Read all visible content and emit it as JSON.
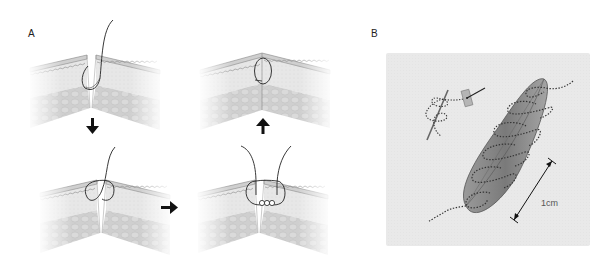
{
  "figure": {
    "panels": [
      {
        "id": "A",
        "label": "A",
        "description": "Four-step interrupted suture sequence through layered skin tissue",
        "steps": [
          {
            "step": 1,
            "state": "needle-through-wound-edges"
          },
          {
            "step": 2,
            "state": "loop-formed-across-gap"
          },
          {
            "step": 3,
            "state": "knot-tied-with-free-ends"
          },
          {
            "step": 4,
            "state": "wound-closed-with-suture"
          }
        ],
        "arrows": [
          "down",
          "right",
          "up"
        ]
      },
      {
        "id": "B",
        "label": "B",
        "description": "Running suture along elliptical incision with scale bar",
        "scale_bar_label": "1cm"
      }
    ],
    "colors": {
      "background": "#ffffff",
      "panel_b_background": "#e6e6e6",
      "epidermis": "#d2d2d2",
      "dermis": "#e4e4e4",
      "subcutis": "#c6c6c6",
      "incision": "#8a8a8a",
      "suture": "#222222"
    }
  }
}
